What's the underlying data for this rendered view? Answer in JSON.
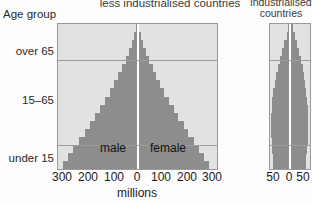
{
  "figure": {
    "axis_header": "Age group",
    "left_title": "less industrialised countries",
    "right_title_line1": "industrialised",
    "right_title_line2": "countries",
    "x_axis_title": "millions",
    "male_label": "male",
    "female_label": "female",
    "colors": {
      "plot_background": "#e2e2e2",
      "bar_fill": "#8d8d8d",
      "border": "#9a9a9a",
      "gridline": "#9d9d9d",
      "center_axis": "#ffffff"
    }
  },
  "chart_data": {
    "type": "bar",
    "subtype": "population-pyramid",
    "xlabel": "millions",
    "ylabel": "Age group",
    "grid": true,
    "legend_position": "in-plot",
    "age_band_labels": [
      "over 65",
      "15–65",
      "under 15"
    ],
    "age_band_boundaries_years": [
      65,
      15
    ],
    "panels": [
      {
        "name": "less industrialised countries",
        "xlim": [
          -300,
          300
        ],
        "xticks": [
          300,
          200,
          100,
          0,
          100,
          200,
          300
        ],
        "xtick_unit": "millions",
        "series": [
          {
            "name": "male",
            "side": "left"
          },
          {
            "name": "female",
            "side": "right"
          }
        ],
        "age_groups": [
          "0-4",
          "5-9",
          "10-14",
          "15-19",
          "20-24",
          "25-29",
          "30-34",
          "35-39",
          "40-44",
          "45-49",
          "50-54",
          "55-59",
          "60-64",
          "65-69",
          "70-74",
          "75-79",
          "80-84",
          "85+"
        ],
        "male": [
          280,
          262,
          243,
          222,
          200,
          181,
          160,
          141,
          122,
          104,
          88,
          72,
          58,
          44,
          32,
          21,
          12,
          6
        ],
        "female": [
          268,
          251,
          233,
          213,
          192,
          174,
          154,
          136,
          118,
          101,
          86,
          71,
          58,
          45,
          33,
          22,
          13,
          7
        ]
      },
      {
        "name": "industrialised countries",
        "xlim": [
          -50,
          50
        ],
        "xticks": [
          50,
          0,
          50
        ],
        "xtick_unit": "millions",
        "series": [
          {
            "name": "male",
            "side": "left"
          },
          {
            "name": "female",
            "side": "right"
          }
        ],
        "age_groups": [
          "0-4",
          "5-9",
          "10-14",
          "15-19",
          "20-24",
          "25-29",
          "30-34",
          "35-39",
          "40-44",
          "45-49",
          "50-54",
          "55-59",
          "60-64",
          "65-69",
          "70-74",
          "75-79",
          "80-84",
          "85+"
        ],
        "male": [
          42,
          43,
          44,
          46,
          47,
          48,
          47,
          46,
          44,
          42,
          38,
          34,
          30,
          25,
          20,
          14,
          8,
          4
        ],
        "female": [
          40,
          41,
          42,
          44,
          45,
          46,
          46,
          45,
          43,
          41,
          38,
          35,
          32,
          28,
          23,
          18,
          12,
          7
        ]
      }
    ]
  },
  "y_axis": {
    "ticks": [
      {
        "label": "over 65",
        "top_px": 45
      },
      {
        "label": "15–65",
        "top_px": 94
      },
      {
        "label": "under 15",
        "top_px": 152
      }
    ]
  },
  "x_axis_left": {
    "ticks": [
      {
        "label": "300",
        "center_px": 62
      },
      {
        "label": "200",
        "center_px": 88
      },
      {
        "label": "100",
        "center_px": 114
      },
      {
        "label": "0",
        "center_px": 137
      },
      {
        "label": "100",
        "center_px": 161
      },
      {
        "label": "200",
        "center_px": 187
      },
      {
        "label": "300",
        "center_px": 212
      }
    ],
    "title": "millions",
    "title_center_px": 137
  },
  "x_axis_right": {
    "ticks": [
      {
        "label": "50",
        "center_px": 273
      },
      {
        "label": "0",
        "center_px": 289
      },
      {
        "label": "50",
        "center_px": 303
      }
    ]
  }
}
